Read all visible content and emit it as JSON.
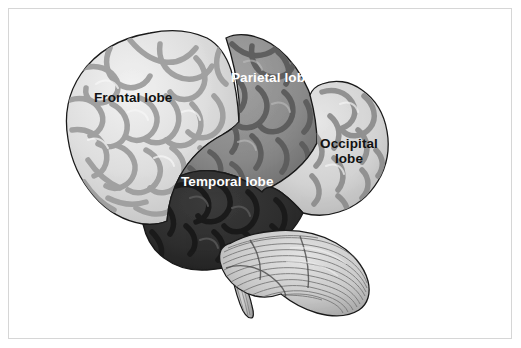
{
  "figure": {
    "background_color": "#ffffff",
    "frame_color": "#d6d6d6",
    "outline_color": "#1a1a1a"
  },
  "labels": {
    "frontal": "Frontal lobe",
    "parietal": "Parietal lobe",
    "temporal": "Temporal lobe",
    "occipital_line1": "Occipital",
    "occipital_line2": "lobe"
  },
  "regions": {
    "frontal": {
      "name": "frontal-lobe",
      "label": "Frontal lobe",
      "fill": "#dcdcdc",
      "sulci": "#9a9a9a",
      "label_color": "#121212"
    },
    "parietal": {
      "name": "parietal-lobe",
      "label": "Parietal lobe",
      "fill": "#8d8d8d",
      "sulci": "#5e5e5e",
      "label_color": "#ffffff"
    },
    "temporal": {
      "name": "temporal-lobe",
      "label": "Temporal lobe",
      "fill": "#2f2f2f",
      "sulci": "#1b1b1b",
      "label_color": "#ffffff"
    },
    "occipital": {
      "name": "occipital-lobe",
      "label": "Occipital lobe",
      "fill": "#d2d2d2",
      "sulci": "#8f8f8f",
      "label_color": "#121212"
    },
    "cerebellum": {
      "name": "cerebellum",
      "label": "",
      "fill": "#cfcfcf",
      "striations": "#6f6f6f",
      "label_color": ""
    },
    "brainstem": {
      "name": "brainstem",
      "label": "",
      "fill": "#c9c9c9",
      "striations": "#6f6f6f",
      "label_color": ""
    }
  }
}
